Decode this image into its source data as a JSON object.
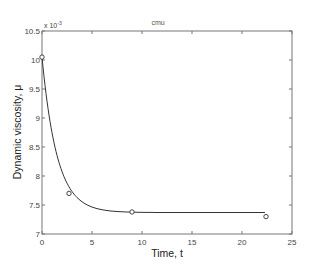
{
  "chart_data": {
    "type": "line",
    "title": "cmu",
    "xlabel": "Time, t",
    "ylabel": "Dynamic viscosity, μ",
    "y_multiplier_label": "x 10",
    "y_multiplier_exp": "-3",
    "xlim": [
      0,
      25
    ],
    "ylim": [
      7,
      10.5
    ],
    "x_ticks": [
      0,
      5,
      10,
      15,
      20,
      25
    ],
    "y_ticks": [
      7,
      7.5,
      8,
      8.5,
      9,
      9.5,
      10,
      10.5
    ],
    "x_tick_labels": [
      "0",
      "5",
      "10",
      "15",
      "20",
      "25"
    ],
    "y_tick_labels": [
      "7",
      "7.5",
      "8",
      "8.5",
      "9",
      "9.5",
      "10",
      "10.5"
    ],
    "grid": false,
    "series": [
      {
        "name": "measured",
        "style": "open-circle markers",
        "x": [
          0,
          2.7,
          9.0,
          22.4
        ],
        "y": [
          10.05,
          7.7,
          7.38,
          7.3
        ]
      },
      {
        "name": "fit",
        "style": "solid line",
        "model": "exponential decay y = 7.37 + 2.68*exp(-t/1.5)",
        "x": [
          0,
          0.5,
          1,
          1.5,
          2,
          2.5,
          3,
          4,
          5,
          6,
          8,
          10,
          13,
          16,
          20,
          22.4
        ],
        "y": [
          10.05,
          9.29,
          8.74,
          8.36,
          8.07,
          7.87,
          7.73,
          7.55,
          7.46,
          7.42,
          7.39,
          7.38,
          7.37,
          7.37,
          7.37,
          7.37
        ]
      }
    ]
  }
}
